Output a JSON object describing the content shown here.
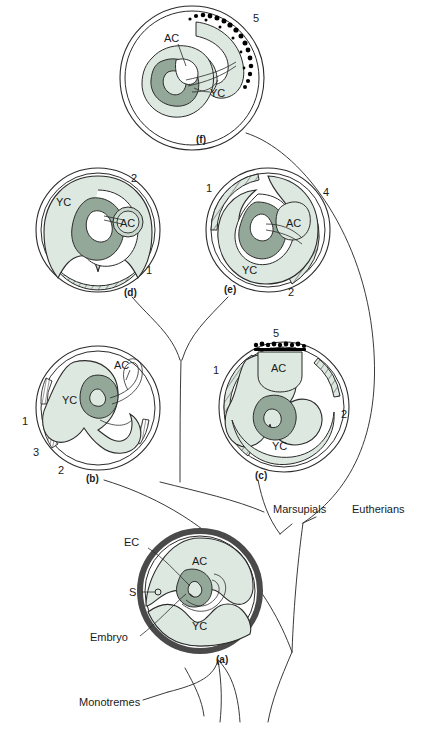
{
  "figure": {
    "title": "",
    "background": "#ffffff",
    "colors": {
      "light_fill": "#dde8e0",
      "mid_fill": "#c9d8cd",
      "embryo_fill": "#93a898",
      "outline": "#2b2b2b",
      "eggshell": "#4a4a4a",
      "villi": "#000000",
      "text": "#1a1a1a"
    }
  },
  "panels": [
    {
      "id": "f",
      "caption": "(f)",
      "structures": [
        {
          "label": "AC"
        },
        {
          "label": "YC"
        }
      ],
      "numbers": [
        "5"
      ]
    },
    {
      "id": "d",
      "caption": "(d)",
      "structures": [
        {
          "label": "YC"
        },
        {
          "label": "AC"
        }
      ],
      "numbers": [
        "2",
        "1"
      ]
    },
    {
      "id": "e",
      "caption": "(e)",
      "structures": [
        {
          "label": "AC"
        },
        {
          "label": "YC"
        }
      ],
      "numbers": [
        "1",
        "4",
        "2"
      ]
    },
    {
      "id": "b",
      "caption": "(b)",
      "structures": [
        {
          "label": "AC"
        },
        {
          "label": "YC"
        }
      ],
      "numbers": [
        "1",
        "3",
        "2"
      ]
    },
    {
      "id": "c",
      "caption": "(c)",
      "structures": [
        {
          "label": "AC"
        },
        {
          "label": "YC"
        }
      ],
      "numbers": [
        "5",
        "1",
        "2"
      ]
    },
    {
      "id": "a",
      "caption": "(a)",
      "structures": [
        {
          "label": "EC"
        },
        {
          "label": "S"
        },
        {
          "label": "Embryo"
        },
        {
          "label": "AC"
        },
        {
          "label": "YC"
        }
      ],
      "numbers": []
    }
  ],
  "taxa": [
    {
      "name": "Marsupials"
    },
    {
      "name": "Eutherians"
    },
    {
      "name": "Monotremes"
    }
  ],
  "legend_text": {
    "ac": "AC",
    "yc": "YC",
    "ec": "EC",
    "s": "S",
    "embryo": "Embryo",
    "marsupials": "Marsupials",
    "eutherians": "Eutherians",
    "monotremes": "Monotremes",
    "n1": "1",
    "n2": "2",
    "n3": "3",
    "n4": "4",
    "n5": "5",
    "cap_a": "(a)",
    "cap_b": "(b)",
    "cap_c": "(c)",
    "cap_d": "(d)",
    "cap_e": "(e)",
    "cap_f": "(f)"
  }
}
